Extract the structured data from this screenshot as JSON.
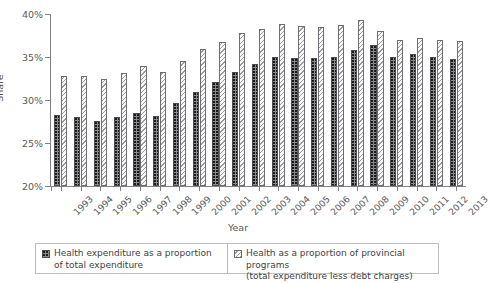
{
  "axes": {
    "ylabel": "Share",
    "xlabel": "Year",
    "yticks": [
      "20%",
      "25%",
      "30%",
      "35%",
      "40%"
    ]
  },
  "legend": {
    "series1_line1": "Health expenditure as a proportion",
    "series1_line2": "of total expenditure",
    "series2_line1": "Health as a proportion of provincial programs",
    "series2_line2": "(total expenditure less debt charges)"
  },
  "chart_data": {
    "type": "bar",
    "title": "",
    "xlabel": "Year",
    "ylabel": "Share",
    "ylim": [
      20,
      40
    ],
    "ytick_values": [
      20,
      25,
      30,
      35,
      40
    ],
    "grid": false,
    "legend_position": "bottom",
    "categories": [
      "1993",
      "1994",
      "1995",
      "1996",
      "1997",
      "1998",
      "1999",
      "2000",
      "2001",
      "2002",
      "2003",
      "2004",
      "2005",
      "2006",
      "2007",
      "2008",
      "2009",
      "2010",
      "2011",
      "2012",
      "2013"
    ],
    "series": [
      {
        "name": "Health expenditure as a proportion of total expenditure",
        "style": "dotted-dark",
        "color": "#8a8c8e",
        "values": [
          28.2,
          28.0,
          27.6,
          28.0,
          28.5,
          28.1,
          29.7,
          30.9,
          32.1,
          33.2,
          34.2,
          35.0,
          34.9,
          34.9,
          35.0,
          35.8,
          36.4,
          35.0,
          35.4,
          35.0,
          34.8
        ]
      },
      {
        "name": "Health as a proportion of provincial programs (total expenditure less debt charges)",
        "style": "hatched-light",
        "color": "#f7f7f7",
        "values": [
          32.8,
          32.8,
          32.5,
          33.1,
          34.0,
          33.2,
          34.5,
          35.9,
          36.8,
          37.8,
          38.3,
          38.8,
          38.6,
          38.5,
          38.7,
          39.3,
          38.0,
          37.0,
          37.2,
          37.0,
          36.9
        ]
      }
    ]
  }
}
